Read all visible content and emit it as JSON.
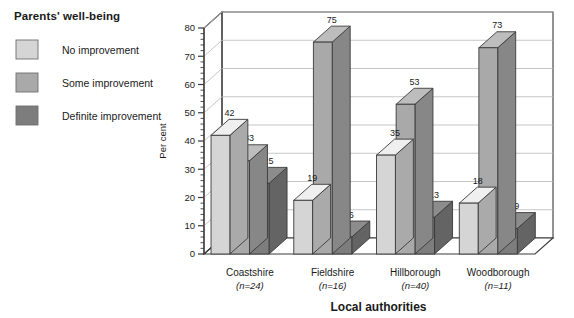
{
  "legend": {
    "title": "Parents' well-being",
    "items": [
      {
        "label": "No improvement",
        "color": "#d5d5d5"
      },
      {
        "label": "Some improvement",
        "color": "#a9a9a9"
      },
      {
        "label": "Definite improvement",
        "color": "#7d7d7d"
      }
    ]
  },
  "axes": {
    "y_title": "Per cent",
    "x_title": "Local authorities",
    "y_ticks": [
      "0",
      "10",
      "20",
      "30",
      "40",
      "50",
      "60",
      "70",
      "80"
    ]
  },
  "chart_data": {
    "type": "bar",
    "title": "Parents' well-being",
    "xlabel": "Local authorities",
    "ylabel": "Per cent",
    "ylim": [
      0,
      80
    ],
    "ytick_step": 10,
    "yminor_step": 2,
    "grid": true,
    "legend_position": "left-outside",
    "three_d": true,
    "categories": [
      "Coastshire",
      "Fieldshire",
      "Hillborough",
      "Woodborough"
    ],
    "category_sublabels": [
      "(n=24)",
      "(n=16)",
      "(n=40)",
      "(n=11)"
    ],
    "series": [
      {
        "name": "No improvement",
        "color": "#d5d5d5",
        "values": [
          42,
          19,
          35,
          18
        ]
      },
      {
        "name": "Some improvement",
        "color": "#a9a9a9",
        "values": [
          33,
          75,
          53,
          73
        ]
      },
      {
        "name": "Definite improvement",
        "color": "#7d7d7d",
        "values": [
          25,
          6,
          13,
          9
        ]
      }
    ]
  },
  "colors": {
    "axis": "#3a3a3a",
    "grid": "#b8b8b8",
    "wall": "#ffffff",
    "floor": "#ffffff",
    "text": "#1a1a1a"
  }
}
